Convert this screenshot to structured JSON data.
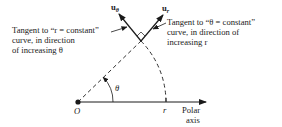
{
  "diagram": {
    "vectors": [
      {
        "name": "u_theta",
        "base": "u",
        "subscript": "θ"
      },
      {
        "name": "u_r",
        "base": "u",
        "subscript": "r"
      }
    ],
    "annotations": {
      "left": {
        "lines": [
          "Tangent to “r = constant”",
          "curve, in direction",
          "of increasing θ"
        ]
      },
      "right": {
        "lines": [
          "Tangent to “θ = constant”",
          "curve, in direction of",
          "increasing r"
        ]
      }
    },
    "origin_label": "O",
    "angle_label": "θ",
    "radius_label": "r",
    "axis_label": [
      "Polar",
      "axis"
    ],
    "colors": {
      "line": "#1a1a1a",
      "background": "#ffffff"
    }
  }
}
